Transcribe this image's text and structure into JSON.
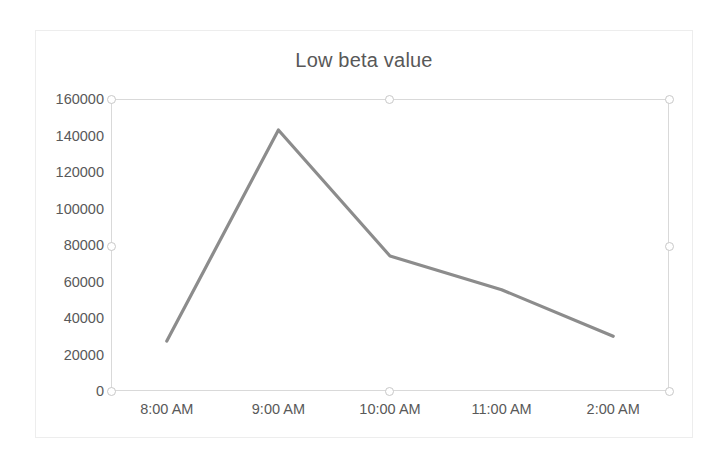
{
  "chart_data": {
    "type": "line",
    "title": "Low beta value",
    "xlabel": "",
    "ylabel": "",
    "categories": [
      "8:00 AM",
      "9:00 AM",
      "10:00 AM",
      "11:00 AM",
      "2:00 AM"
    ],
    "values": [
      27400,
      143000,
      74000,
      55500,
      30000
    ],
    "series": [
      {
        "name": "Low beta value",
        "values": [
          27400,
          143000,
          74000,
          55500,
          30000
        ],
        "color": "#8c8c8c"
      }
    ],
    "ylim": [
      0,
      160000
    ],
    "yticks": [
      0,
      20000,
      40000,
      60000,
      80000,
      100000,
      120000,
      140000,
      160000
    ],
    "ytick_labels": [
      "0",
      "20000",
      "40000",
      "60000",
      "80000",
      "100000",
      "120000",
      "140000",
      "160000"
    ],
    "grid": false,
    "legend": false,
    "legend_position": "none",
    "plot_border": true
  },
  "chart": {
    "title": "Low beta value",
    "line_color": "#8c8c8c",
    "border_color": "#d9d9d9",
    "card_border_color": "#ededed",
    "axis_text_color": "#595959",
    "title_color": "#585858"
  },
  "selection": {
    "handle_color": "#c8c8c8",
    "handles": [
      {
        "name": "handle-top-left",
        "x": 0,
        "y": 0
      },
      {
        "name": "handle-top-center",
        "x": 278,
        "y": 0
      },
      {
        "name": "handle-top-right",
        "x": 558,
        "y": 0
      },
      {
        "name": "handle-middle-left",
        "x": 0,
        "y": 147
      },
      {
        "name": "handle-middle-right",
        "x": 558,
        "y": 147
      },
      {
        "name": "handle-bottom-left",
        "x": 0,
        "y": 292
      },
      {
        "name": "handle-bottom-center",
        "x": 278,
        "y": 292
      },
      {
        "name": "handle-bottom-right",
        "x": 558,
        "y": 292
      }
    ]
  }
}
